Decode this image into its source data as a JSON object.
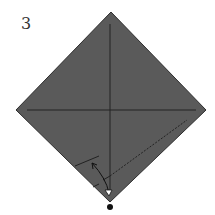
{
  "diagram": {
    "type": "origami-step",
    "step_number": "3",
    "paper_color": "#5a5a5a",
    "edge_color": "#2e2e2e",
    "crease_color": "#222222",
    "dot_color": "#111111",
    "arrow_color": "#ffffff"
  }
}
